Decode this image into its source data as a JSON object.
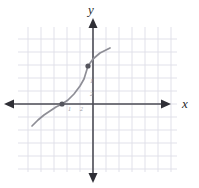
{
  "figure": {
    "type": "coordinate-plane-graph",
    "width": 199,
    "height": 188,
    "background_color": "#ffffff"
  },
  "axes": {
    "x_axis_label": "x",
    "y_axis_label": "y",
    "axis_color": "#4d4d55",
    "grid_color": "#dedee8",
    "origin_px": {
      "x": 93,
      "y": 104
    },
    "grid_spacing_px": 13,
    "grid_bounds_px": {
      "left": 18,
      "top": 27,
      "right": 177,
      "bottom": 172
    },
    "arrowheads": [
      "left",
      "right",
      "up",
      "down"
    ]
  },
  "tick_labels": [
    {
      "text": "1",
      "x": 90,
      "y": 78
    },
    {
      "text": "2",
      "x": 90,
      "y": 91
    },
    {
      "text": "1",
      "x": 68,
      "y": 106
    },
    {
      "text": "2",
      "x": 80,
      "y": 106
    }
  ],
  "chart_data": {
    "type": "line",
    "title": "",
    "xlabel": "x",
    "ylabel": "y",
    "grid": true,
    "legend": "none",
    "curve_color": "#8e8e96",
    "point_color": "#55555d",
    "xlim": [
      -5.8,
      6.5
    ],
    "ylim": [
      -5.2,
      5.9
    ],
    "series": [
      {
        "name": "curve",
        "points_px": [
          [
            32,
            126
          ],
          [
            38,
            120
          ],
          [
            44,
            115
          ],
          [
            50,
            111
          ],
          [
            56,
            107
          ],
          [
            62,
            104
          ],
          [
            68,
            100
          ],
          [
            74,
            94
          ],
          [
            80,
            86
          ],
          [
            84,
            79
          ],
          [
            88,
            66
          ],
          [
            93,
            59
          ],
          [
            100,
            53
          ],
          [
            110,
            48
          ]
        ]
      }
    ],
    "marked_points_px": [
      {
        "x": 62,
        "y": 104
      },
      {
        "x": 88,
        "y": 66
      }
    ]
  }
}
